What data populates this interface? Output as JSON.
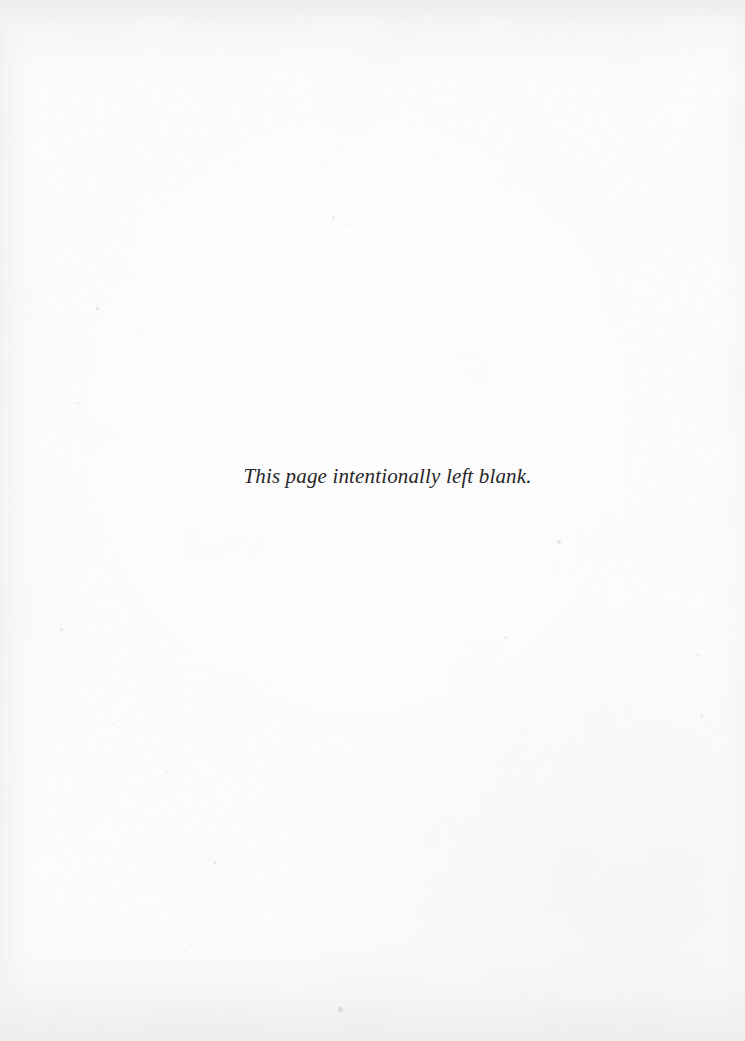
{
  "page": {
    "kind": "scanned-book-page",
    "width": 745,
    "height": 1041,
    "paper_color": "#fdfdfd",
    "edge_shade_color": "#eeeef0"
  },
  "content": {
    "notice_text": "This page intentionally left blank."
  },
  "typography": {
    "notice_color": "#27262a",
    "notice_style": "italic-serif",
    "notice_size_px": 21
  },
  "artifacts": {
    "label": "scan-dust-specks",
    "speck_color": "#cfcfd2",
    "specks": [
      {
        "x": 96,
        "y": 307,
        "w": 3,
        "h": 3,
        "o": 0.55
      },
      {
        "x": 140,
        "y": 330,
        "w": 2,
        "h": 2,
        "o": 0.35
      },
      {
        "x": 76,
        "y": 402,
        "w": 3,
        "h": 2,
        "o": 0.4
      },
      {
        "x": 60,
        "y": 628,
        "w": 3,
        "h": 3,
        "o": 0.45
      },
      {
        "x": 112,
        "y": 723,
        "w": 2,
        "h": 2,
        "o": 0.35
      },
      {
        "x": 166,
        "y": 771,
        "w": 3,
        "h": 2,
        "o": 0.35
      },
      {
        "x": 213,
        "y": 861,
        "w": 3,
        "h": 3,
        "o": 0.45
      },
      {
        "x": 237,
        "y": 161,
        "w": 2,
        "h": 2,
        "o": 0.3
      },
      {
        "x": 325,
        "y": 162,
        "w": 2,
        "h": 2,
        "o": 0.3
      },
      {
        "x": 332,
        "y": 216,
        "w": 3,
        "h": 3,
        "o": 0.4
      },
      {
        "x": 345,
        "y": 224,
        "w": 2,
        "h": 2,
        "o": 0.35
      },
      {
        "x": 404,
        "y": 247,
        "w": 2,
        "h": 2,
        "o": 0.3
      },
      {
        "x": 449,
        "y": 251,
        "w": 2,
        "h": 2,
        "o": 0.28
      },
      {
        "x": 380,
        "y": 355,
        "w": 2,
        "h": 2,
        "o": 0.3
      },
      {
        "x": 557,
        "y": 540,
        "w": 4,
        "h": 4,
        "o": 0.5
      },
      {
        "x": 606,
        "y": 540,
        "w": 2,
        "h": 2,
        "o": 0.3
      },
      {
        "x": 504,
        "y": 636,
        "w": 3,
        "h": 3,
        "o": 0.35
      },
      {
        "x": 551,
        "y": 652,
        "w": 2,
        "h": 2,
        "o": 0.3
      },
      {
        "x": 697,
        "y": 654,
        "w": 3,
        "h": 3,
        "o": 0.35
      },
      {
        "x": 549,
        "y": 689,
        "w": 2,
        "h": 2,
        "o": 0.28
      },
      {
        "x": 700,
        "y": 714,
        "w": 3,
        "h": 3,
        "o": 0.4
      },
      {
        "x": 478,
        "y": 740,
        "w": 2,
        "h": 2,
        "o": 0.3
      },
      {
        "x": 505,
        "y": 724,
        "w": 2,
        "h": 2,
        "o": 0.28
      },
      {
        "x": 443,
        "y": 742,
        "w": 2,
        "h": 2,
        "o": 0.3
      },
      {
        "x": 415,
        "y": 790,
        "w": 2,
        "h": 2,
        "o": 0.28
      },
      {
        "x": 338,
        "y": 1007,
        "w": 5,
        "h": 5,
        "o": 0.75
      },
      {
        "x": 190,
        "y": 944,
        "w": 2,
        "h": 2,
        "o": 0.3
      },
      {
        "x": 655,
        "y": 905,
        "w": 2,
        "h": 2,
        "o": 0.28
      },
      {
        "x": 627,
        "y": 118,
        "w": 2,
        "h": 2,
        "o": 0.28
      },
      {
        "x": 258,
        "y": 52,
        "w": 2,
        "h": 2,
        "o": 0.25
      }
    ]
  }
}
